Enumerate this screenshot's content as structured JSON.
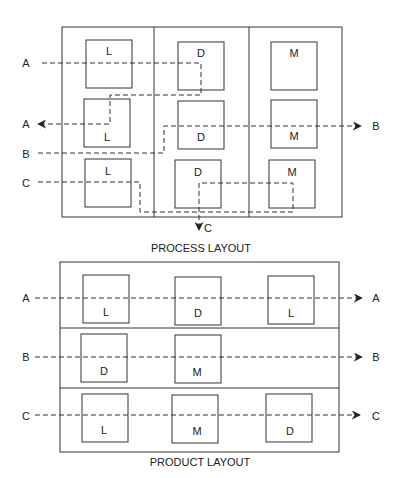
{
  "process_layout": {
    "caption": "PROCESS LAYOUT",
    "departments": [
      {
        "machine": "L",
        "boxes": [
          "L",
          "L",
          "L"
        ]
      },
      {
        "machine": "D",
        "boxes": [
          "D",
          "D",
          "D"
        ]
      },
      {
        "machine": "M",
        "boxes": [
          "M",
          "M",
          "M"
        ]
      }
    ],
    "flows": [
      {
        "label_in": "A",
        "label_out": "A"
      },
      {
        "label_in": "B",
        "label_out": "B"
      },
      {
        "label_in": "C",
        "label_out": "C"
      }
    ]
  },
  "product_layout": {
    "caption": "PRODUCT LAYOUT",
    "lines": [
      {
        "label_in": "A",
        "label_out": "A",
        "machines": [
          "L",
          "D",
          "L"
        ]
      },
      {
        "label_in": "B",
        "label_out": "B",
        "machines": [
          "D",
          "M"
        ]
      },
      {
        "label_in": "C",
        "label_out": "C",
        "machines": [
          "L",
          "M",
          "D"
        ]
      }
    ]
  },
  "colors": {
    "line": "#333333",
    "background": "#ffffff"
  }
}
